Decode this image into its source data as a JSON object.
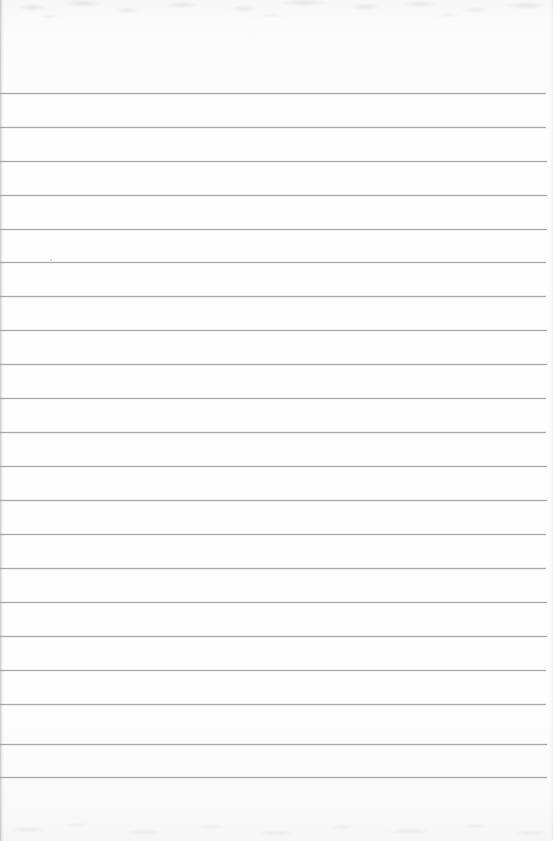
{
  "document": {
    "kind": "scanned-lined-notebook-page",
    "title": "Blank Lined Notebook Page",
    "page_width": 553,
    "page_height": 841,
    "background_color": "#fcfcfd",
    "has_text_content": false,
    "written_text": "",
    "notes_label": "",
    "page_number_label": ""
  },
  "ruling": {
    "line_color": "#9a9b9f",
    "line_thickness_px": 1,
    "line_count": 21,
    "first_line_y": 93,
    "line_spacing_px": 33.3,
    "line_left_x": 0,
    "line_right_x": 546,
    "top_margin_px": 93,
    "bottom_margin_px": 64,
    "right_margin_px": 7,
    "lines": [
      {
        "index": 1,
        "y": 93,
        "x1": 0,
        "x2": 546
      },
      {
        "index": 2,
        "y": 127,
        "x1": 0,
        "x2": 546
      },
      {
        "index": 3,
        "y": 161,
        "x1": 0,
        "x2": 547
      },
      {
        "index": 4,
        "y": 195,
        "x1": 0,
        "x2": 547
      },
      {
        "index": 5,
        "y": 229,
        "x1": 0,
        "x2": 547
      },
      {
        "index": 6,
        "y": 262,
        "x1": 0,
        "x2": 546
      },
      {
        "index": 7,
        "y": 296,
        "x1": 0,
        "x2": 546
      },
      {
        "index": 8,
        "y": 330,
        "x1": 0,
        "x2": 547
      },
      {
        "index": 9,
        "y": 364,
        "x1": 0,
        "x2": 547
      },
      {
        "index": 10,
        "y": 398,
        "x1": 0,
        "x2": 546
      },
      {
        "index": 11,
        "y": 432,
        "x1": 0,
        "x2": 546
      },
      {
        "index": 12,
        "y": 466,
        "x1": 0,
        "x2": 547
      },
      {
        "index": 13,
        "y": 500,
        "x1": 0,
        "x2": 547
      },
      {
        "index": 14,
        "y": 534,
        "x1": 0,
        "x2": 546
      },
      {
        "index": 15,
        "y": 568,
        "x1": 0,
        "x2": 546
      },
      {
        "index": 16,
        "y": 602,
        "x1": 0,
        "x2": 547
      },
      {
        "index": 17,
        "y": 636,
        "x1": 0,
        "x2": 547
      },
      {
        "index": 18,
        "y": 670,
        "x1": 0,
        "x2": 546
      },
      {
        "index": 19,
        "y": 704,
        "x1": 0,
        "x2": 546
      },
      {
        "index": 20,
        "y": 744,
        "x1": 0,
        "x2": 547
      },
      {
        "index": 21,
        "y": 777,
        "x1": 0,
        "x2": 547
      }
    ]
  },
  "artifacts": {
    "left_edge_shadow_color": "#96979c",
    "scan_noise_color": "#b8b9bd",
    "specks": [
      {
        "x": 50,
        "y": 259,
        "size": 2.2
      },
      {
        "x": 47,
        "y": 262,
        "size": 1.4
      }
    ]
  }
}
